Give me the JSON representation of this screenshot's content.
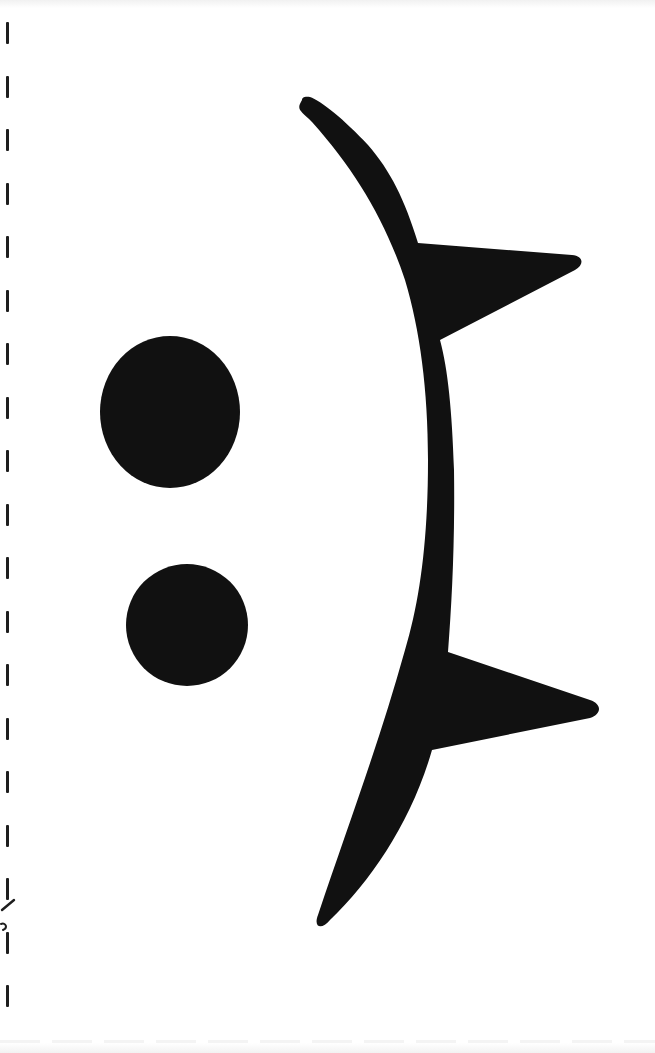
{
  "page": {
    "background_color": "#ffffff",
    "ink_color": "#111111"
  },
  "emoticon": {
    "text": ":(",
    "parts": [
      "upper-dot",
      "lower-dot",
      "curved-stroke",
      "upper-spike",
      "lower-spike"
    ]
  },
  "cut_line": {
    "style": "dashed",
    "dash_count": 19,
    "has_scissors_mark": true
  },
  "showthrough_text": {
    "text": "",
    "legible": false
  }
}
